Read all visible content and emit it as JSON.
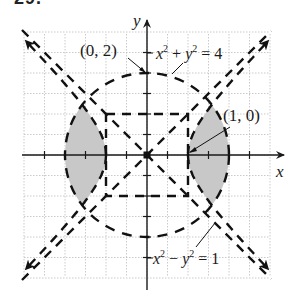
{
  "problem_number": "29.",
  "axes": {
    "x_label": "x",
    "y_label": "y",
    "origin_px": [
      147,
      155
    ],
    "unit_px": 41,
    "grid_step": 0.5,
    "x_range": [
      -3,
      3
    ],
    "y_range": [
      -3,
      3
    ]
  },
  "curves": [
    {
      "name": "circle",
      "equation_label": "x² + y² = 4",
      "style": "dashed",
      "radius": 2
    },
    {
      "name": "hyperbola",
      "equation_label": "x² − y² = 1",
      "style": "dashed"
    },
    {
      "name": "asymptotes",
      "equations": [
        "y = x",
        "y = −x"
      ],
      "style": "dashed"
    },
    {
      "name": "guide-square",
      "corners": [
        [
          -1,
          -1
        ],
        [
          1,
          1
        ]
      ],
      "style": "dashed"
    }
  ],
  "points": [
    {
      "label": "(0, 2)",
      "x": 0,
      "y": 2
    },
    {
      "label": "(1, 0)",
      "x": 1,
      "y": 0
    }
  ],
  "labels": {
    "circle_eq": {
      "x_part": "x",
      "sup1": "2",
      "plus": " + ",
      "y_part": "y",
      "sup2": "2",
      "rhs": " = 4"
    },
    "hyperbola_eq": {
      "x_part": "x",
      "sup1": "2",
      "minus": " − ",
      "y_part": "y",
      "sup2": "2",
      "rhs": " = 1"
    },
    "point_0_2": "(0, 2)",
    "point_1_0": "(1, 0)"
  },
  "shading": {
    "description": "Region between hyperbola branches and circle: 1 ≤ |x|, x² − y² ≥ 1, x² + y² ≤ 4",
    "color": "#c8c8c8"
  },
  "colors": {
    "grid": "#b8b8b8",
    "axis": "#1a1a1a",
    "curve": "#111111",
    "shade": "#c8c8c8"
  }
}
